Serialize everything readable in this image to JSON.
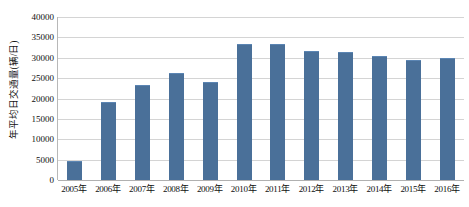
{
  "chart_data": {
    "type": "bar",
    "title": "",
    "xlabel": "",
    "ylabel": "年平均日交通量(辆/日)",
    "ylim": [
      0,
      40000
    ],
    "ystep": 5000,
    "grid": true,
    "legend": "none",
    "yticks": [
      "40000",
      "35000",
      "30000",
      "25000",
      "20000",
      "15000",
      "10000",
      "5000",
      "0"
    ],
    "categories": [
      "2005年",
      "2006年",
      "2007年",
      "2008年",
      "2009年",
      "2010年",
      "2011年",
      "2012年",
      "2013年",
      "2014年",
      "2015年",
      "2016年"
    ],
    "values": [
      4400,
      19000,
      23000,
      26000,
      23700,
      33200,
      33200,
      31300,
      31100,
      30200,
      29300,
      29700
    ],
    "series_name": "年平均日交通量",
    "bar_color": "#4a7099",
    "grid_color": "#d4d4d4",
    "axis_color": "#b0b0b0"
  }
}
